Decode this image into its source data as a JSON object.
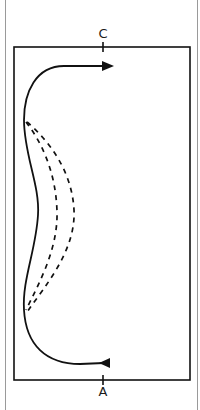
{
  "diagram": {
    "type": "path-diagram",
    "labels": {
      "top": "C",
      "bottom": "A"
    },
    "colors": {
      "stroke": "#111111",
      "frame": "#9a9a9a",
      "background": "#ffffff"
    },
    "elements": [
      {
        "id": "inner-rectangle",
        "kind": "rectangle"
      },
      {
        "id": "solid-path",
        "kind": "solid curved arrow",
        "from": "A",
        "to": "C"
      },
      {
        "id": "dashed-path-1",
        "kind": "dashed curve variant"
      },
      {
        "id": "dashed-path-2",
        "kind": "dashed curve variant"
      }
    ]
  }
}
